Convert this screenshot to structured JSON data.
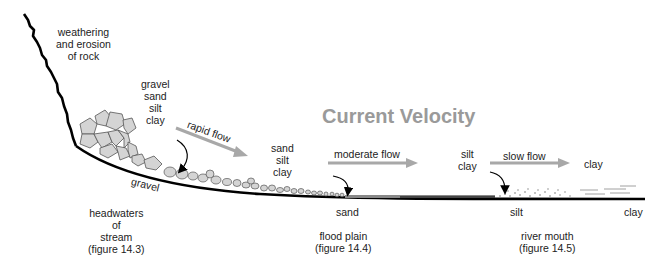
{
  "title": "Current Velocity",
  "colors": {
    "title": "#9a9a9a",
    "arrow": "#a8a8a8",
    "profile": "#000000",
    "rock_fill": "#d4d4d4",
    "rock_stroke": "#555555"
  },
  "labels": {
    "weathering": [
      "weathering",
      "and erosion",
      "of rock"
    ],
    "headwater_load": [
      "gravel",
      "sand",
      "silt",
      "clay"
    ],
    "floodplain_load": [
      "sand",
      "silt",
      "clay"
    ],
    "mouth_load": [
      "silt",
      "clay"
    ],
    "offshore_load": "clay",
    "gravel_bed": "gravel",
    "bed_sand": "sand",
    "bed_silt": "silt",
    "bed_clay": "clay"
  },
  "flows": {
    "rapid": "rapid flow",
    "moderate": "moderate flow",
    "slow": "slow flow"
  },
  "regions": {
    "headwaters": [
      "headwaters",
      "of",
      "stream",
      "(figure 14.3)"
    ],
    "flood_plain": [
      "flood plain",
      "(figure 14.4)"
    ],
    "river_mouth": [
      "river mouth",
      "(figure 14.5)"
    ]
  }
}
